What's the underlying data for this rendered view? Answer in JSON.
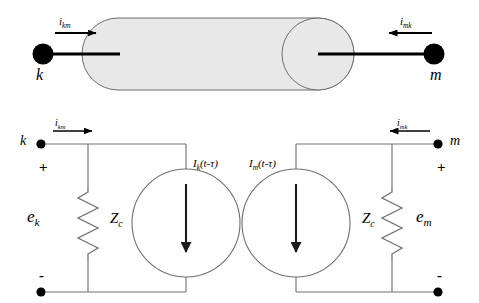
{
  "figure": {
    "type": "transmission-line-equivalent-circuit",
    "colors": {
      "line": "#000000",
      "wire": "#555555",
      "node": "#000000",
      "cylinder_fill": "#e8e8e8",
      "cylinder_stroke": "#777777",
      "background": "#ffffff"
    }
  },
  "top_diagram": {
    "name": "transmission-line-cylinder",
    "terminal_k_label": "k",
    "terminal_m_label": "m",
    "current_left_label": "i",
    "current_left_sub": "km",
    "current_right_label": "i",
    "current_right_sub": "mk",
    "arrow_left_direction": "right",
    "arrow_right_direction": "left"
  },
  "circuit": {
    "name": "norton-equivalent-two-port",
    "left": {
      "node_label": "k",
      "current_label": "i",
      "current_sub": "km",
      "polarity_plus": "+",
      "polarity_minus": "-",
      "voltage_label": "e",
      "voltage_sub": "k",
      "impedance_label": "Z",
      "impedance_sub": "c",
      "source_label": "I",
      "source_sub": "k",
      "source_arg": "(t-τ)",
      "source_arrow_direction": "down"
    },
    "right": {
      "node_label": "m",
      "current_label": "i",
      "current_sub": "mk",
      "polarity_plus": "+",
      "polarity_minus": "-",
      "voltage_label": "e",
      "voltage_sub": "m",
      "impedance_label": "Z",
      "impedance_sub": "c",
      "source_label": "I",
      "source_sub": "m",
      "source_arg": "(t-τ)",
      "source_arrow_direction": "down"
    }
  }
}
